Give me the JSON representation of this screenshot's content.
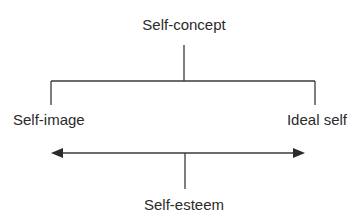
{
  "diagram": {
    "root": "Self-concept",
    "left": "Self-image",
    "right": "Ideal self",
    "bottom": "Self-esteem",
    "line_color": "#3a3a3a",
    "text_color": "#2b2b2b"
  }
}
